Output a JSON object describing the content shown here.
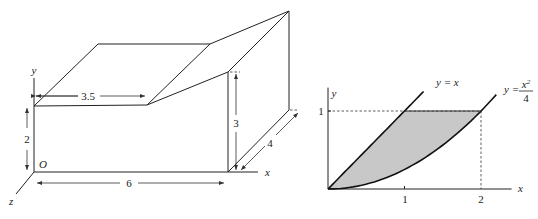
{
  "figure_left": {
    "description": "3D box with sloped roof (storage shed)",
    "axis_labels": {
      "x": "x",
      "y": "y",
      "z": "z",
      "origin": "O"
    },
    "dimensions": {
      "length": "6",
      "height_low": "2",
      "height_high": "3",
      "flat_roof_width": "3.5",
      "depth": "4"
    }
  },
  "figure_right": {
    "description": "Region between y = x and y = x^2/4 bounded by y = 1",
    "axis_labels": {
      "x": "x",
      "y": "y"
    },
    "x_ticks": [
      "1",
      "2"
    ],
    "y_ticks": [
      "1"
    ],
    "curves": [
      {
        "label_lhs": "y = x",
        "expr": "y = x"
      },
      {
        "label_lhs": "y =",
        "numerator": "x",
        "exponent": "2",
        "denominator": "4",
        "expr": "y = x^2/4"
      }
    ],
    "fill_color": "#c8c8c8"
  },
  "chart_data": {
    "type": "area",
    "title": "",
    "xlabel": "x",
    "ylabel": "y",
    "xlim": [
      0,
      2.4
    ],
    "ylim": [
      0,
      1.3
    ],
    "x_ticks": [
      1,
      2
    ],
    "y_ticks": [
      1
    ],
    "series": [
      {
        "name": "y = x",
        "x": [
          0,
          0.25,
          0.5,
          0.75,
          1.0,
          1.25
        ],
        "y": [
          0,
          0.25,
          0.5,
          0.75,
          1.0,
          1.25
        ]
      },
      {
        "name": "y = x^2/4",
        "x": [
          0,
          0.5,
          1.0,
          1.5,
          2.0,
          2.2
        ],
        "y": [
          0,
          0.0625,
          0.25,
          0.5625,
          1.0,
          1.21
        ]
      }
    ],
    "shaded_region": "between y = x and y = x^2/4 for 0 <= y <= 1",
    "reference_lines": [
      {
        "type": "horizontal",
        "y": 1,
        "style": "dashed"
      },
      {
        "type": "vertical",
        "x": 2,
        "style": "dashed"
      }
    ],
    "grid": false
  }
}
